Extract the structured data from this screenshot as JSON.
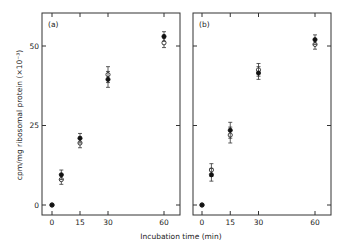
{
  "chart_data": {
    "type": "scatter",
    "xlabel": "Incubation time (min)",
    "ylabel": "cpm/mg ribosomal protein (×10⁻³)",
    "xlim": [
      -3,
      66
    ],
    "ylim": [
      -5,
      60
    ],
    "xticks": [
      0,
      15,
      30,
      60
    ],
    "yticks": [
      0,
      25,
      50
    ],
    "grid": false,
    "legend": "none",
    "panels": [
      {
        "label": "(a)",
        "series": [
          {
            "name": "filled",
            "marker": "filled-circle",
            "x": [
              0,
              5,
              15,
              30,
              60
            ],
            "y": [
              0,
              9.5,
              21,
              39.5,
              53
            ],
            "err": [
              0,
              1.5,
              1.5,
              2.5,
              1.5
            ]
          },
          {
            "name": "open",
            "marker": "open-circle",
            "x": [
              0,
              5,
              15,
              30,
              60
            ],
            "y": [
              0,
              8,
              19.5,
              41,
              51
            ],
            "err": [
              0,
              1.5,
              1.5,
              2.5,
              1.5
            ]
          }
        ]
      },
      {
        "label": "(b)",
        "series": [
          {
            "name": "filled",
            "marker": "filled-circle",
            "x": [
              0,
              5,
              15,
              30,
              60
            ],
            "y": [
              0,
              9.5,
              23.5,
              41.5,
              52
            ],
            "err": [
              0,
              2,
              2.5,
              2,
              1.5
            ]
          },
          {
            "name": "open",
            "marker": "open-circle",
            "x": [
              0,
              5,
              15,
              30,
              60
            ],
            "y": [
              0,
              11,
              22,
              42.5,
              50.5
            ],
            "err": [
              0,
              2,
              2.5,
              2,
              1.5
            ]
          }
        ]
      }
    ]
  }
}
